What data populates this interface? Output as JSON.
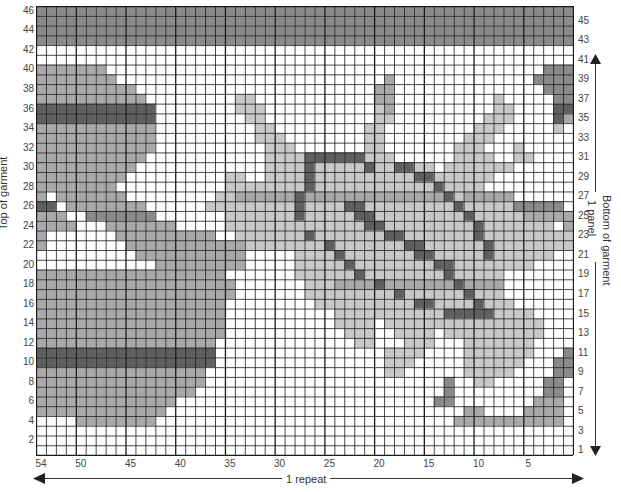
{
  "chart": {
    "columns": 54,
    "rows": 46,
    "legend_shades": {
      ".": "#ffffff",
      "a": "#c8c8c8",
      "b": "#a9a9a9",
      "c": "#8a8a8a",
      "d": "#5f5f5f"
    },
    "grid_line_color": "#1a1a1a",
    "pattern_rows_top_to_bottom": [
      "cccccccccccccccccccccccccccccccccccccccccccccccccccccc",
      "cccccccccccccccccccccccccccccccccccccccccccccccccccccc",
      "cccccccccccccccccccccccccccccccccccccccccccccccccccccc",
      "cccccccccccccccccccccccccccccccccccccccccccccccccccccc",
      "......................................................",
      "......................................................",
      "bbbbbbb............................................ccc",
      "bbbbbbbb...........................b..............cccc",
      "bbbbbbbbbb........................bb...............ccc",
      "bbbbbbbbbbb.........aa............bb..........a.....cc",
      "dddddddddddd........aaa...........ab..........aa....dd",
      "dddddddddddd.........aa...........aa.........aaa....db",
      "bbbbbbbbbbbb..........aa.........aa.........aaa.....a.",
      "bbbbbbbbbbbb..........aaa........aa........aaa........",
      "bbbbbbbbbbbb...........aaa.......aa.......aaa...a.....",
      "bbbbbbbbbbb............aaaaddddddaaa......aaaa..aa....",
      "bbbbbbbbbb.............aaaadaaaaadaaddaa.aaaaaaa......",
      "bbbbbbbbb..........aa..aaaadaaaaaaaaaaddaaaaaa........",
      "bbbbbbbb...........aaaaaaaadaaaaaaaaaaaadaaaa.........",
      "b.bbbbbbb.........aabbbbbbdbbbbbbbbbbbbbbdabbbbb......",
      "dd.bbbbbbbb......aaaaaaaaadaaaaddaaaaaaaaadaaaaaccccc..",
      "bbb..ccccccc.......aaaaaaadaaaaaddaaaaaaaaadaaaaabbbbb",
      "bbbb...bbbbbbb.....aaaaaaaaaaaaaaddaaaaaaaaadaaaaaaa.bb",
      "b.......bbbbbbbbbb..aaaaaaadaaaaaaaddaaaaaaadaaaaaaaaa.",
      "b........bbbbbbbbbbbbaaaaaaaadaaaaaaaddaaaaaadaaaaaaaa.",
      "..........bbbbbbbbbbb.....aaaadaaaaaaaddaaaaadaaaaaa...",
      "............bbbbbbbbb.....aaaaadaaaaaaaaddaaaaaaaa....",
      "bbbbbbbbbbbbbbbbbbb.......aaaaaadaaaaaaaadaaaaa.......",
      "bbbbbbbbbbbbbbbbbbbb.......aaabbbbdbbbbbbbdbbbb.......",
      "bbbbbbbbbbbbbbbbbbbb.......aaaaaaaaadaaaaaadaaa.......",
      "bbbbbbbbbbbbbbbbbbb.........aaaaaaaaaaddaaaadaaa......",
      "bbbbbbbbbbbbbbbbbbb...........aaaaaaaaaaadddddaaaa....",
      "bbbbbbbbbbbbbbbbbbb...........aaaa.aaaaaaaaaaaaaaaa...",
      "bbbbbbbbbbbbbbbbbbb............aaa..aaaa.aaaaaaaaaa...",
      "bbbbbbbbbbbbbbbbbb..............aa...aaa...aaaaaaa....",
      "dddddddddddddddddd.................aaaa....aaaaaaa...c",
      "dddddddddddddddddd.................aaa.....aaaaaa...cc",
      "bbbbbbbbbbbbbbbbb..................aa......aaaaa....cc",
      "bbbbbbbbbbbbbbbbb........................c..aa.....cc",
      "bbbbbbbbbbbbbbbb.........................c.........cc",
      "bbbbbbbbbbbbbb..........................cc........bbb",
      "bbbbbbbbbbbbb..............................bb....bbbb",
      "....bbbbbbbb..............................bbbbbbbbbbb",
      "......................................................",
      "......................................................",
      "......................................................"
    ],
    "left_row_labels": [
      "46",
      "44",
      "42",
      "40",
      "38",
      "36",
      "34",
      "32",
      "30",
      "28",
      "26",
      "24",
      "22",
      "20",
      "18",
      "16",
      "14",
      "12",
      "10",
      "8",
      "6",
      "4",
      "2"
    ],
    "right_row_labels": [
      "45",
      "43",
      "41",
      "39",
      "37",
      "35",
      "33",
      "31",
      "29",
      "27",
      "25",
      "23",
      "21",
      "19",
      "17",
      "15",
      "13",
      "11",
      "9",
      "7",
      "5",
      "3",
      "1"
    ],
    "bottom_col_labels": [
      {
        "label": "54",
        "stitch": 54
      },
      {
        "label": "50",
        "stitch": 50
      },
      {
        "label": "45",
        "stitch": 45
      },
      {
        "label": "40",
        "stitch": 40
      },
      {
        "label": "35",
        "stitch": 35
      },
      {
        "label": "30",
        "stitch": 30
      },
      {
        "label": "25",
        "stitch": 25
      },
      {
        "label": "20",
        "stitch": 20
      },
      {
        "label": "15",
        "stitch": 15
      },
      {
        "label": "10",
        "stitch": 10
      },
      {
        "label": "5",
        "stitch": 5
      }
    ]
  },
  "annotations": {
    "left_side": "Top of garment",
    "right_side_outer": "Bottom of garment",
    "right_side_inner": "1 panel",
    "bottom": "1 repeat"
  }
}
